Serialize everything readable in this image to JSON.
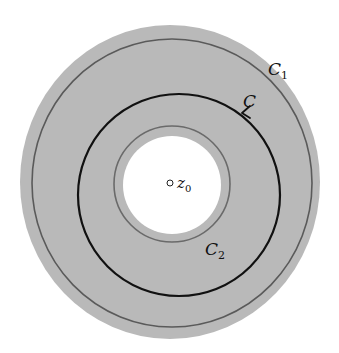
{
  "figure": {
    "colors": {
      "background": "#ffffff",
      "annulus_fill": "#b9b9b9",
      "inner_hole": "#ffffff",
      "c1_stroke": "#5a5a5a",
      "c2_stroke": "#6a6a6a",
      "c_stroke": "#111111"
    },
    "labels": {
      "c1": "C",
      "c1_sub": "1",
      "c": "C",
      "c2": "C",
      "c2_sub": "2",
      "z0": "z",
      "z0_sub": "0"
    }
  }
}
